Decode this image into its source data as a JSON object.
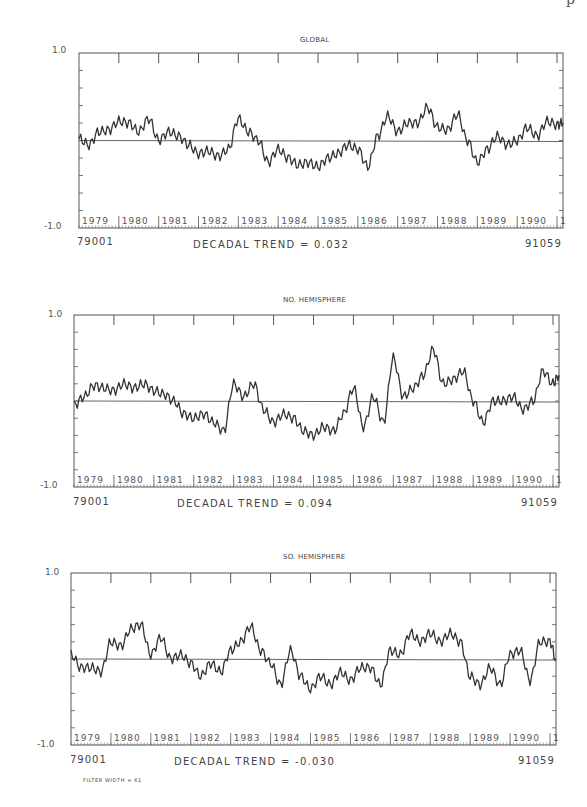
{
  "header_partial_text": "p",
  "footer": {
    "filter_width": "FILTER WIDTH = 61"
  },
  "panels": [
    {
      "title": "GLOBAL",
      "y_max": "1.0",
      "y_min": "-1.0",
      "start_label": "79001",
      "end_label": "91059",
      "trend": "DECADAL TREND =  0.032"
    },
    {
      "title": "NO. HEMISPHERE",
      "y_max": "1.0",
      "y_min": "-1.0",
      "start_label": "79001",
      "end_label": "91059",
      "trend": "DECADAL TREND =  0.094"
    },
    {
      "title": "SO. HEMISPHERE",
      "y_max": "1.0",
      "y_min": "-1.0",
      "start_label": "79001",
      "end_label": "91059",
      "trend": "DECADAL TREND = -0.030"
    }
  ],
  "chart_data": [
    {
      "type": "line",
      "title": "GLOBAL",
      "xlabel": "79001 ... 91059",
      "ylabel": "",
      "ylim": [
        -1.0,
        1.0
      ],
      "x_tick_labels": [
        "1979",
        "1980",
        "1981",
        "1982",
        "1983",
        "1984",
        "1985",
        "1986",
        "1987",
        "1988",
        "1989",
        "1990",
        "1"
      ],
      "annotation": "DECADAL TREND = 0.032",
      "reference_line": 0.0,
      "x": [
        1979.0,
        1979.25,
        1979.5,
        1979.75,
        1980.0,
        1980.25,
        1980.5,
        1980.75,
        1981.0,
        1981.25,
        1981.5,
        1981.75,
        1982.0,
        1982.25,
        1982.5,
        1982.75,
        1983.0,
        1983.25,
        1983.5,
        1983.75,
        1984.0,
        1984.25,
        1984.5,
        1984.75,
        1985.0,
        1985.25,
        1985.5,
        1985.75,
        1986.0,
        1986.25,
        1986.5,
        1986.75,
        1987.0,
        1987.25,
        1987.5,
        1987.75,
        1988.0,
        1988.25,
        1988.5,
        1988.75,
        1989.0,
        1989.25,
        1989.5,
        1989.75,
        1990.0,
        1990.25,
        1990.5,
        1990.75,
        1991.0,
        1991.15
      ],
      "values": [
        0.02,
        -0.05,
        0.1,
        0.12,
        0.22,
        0.2,
        0.1,
        0.25,
        0.0,
        0.1,
        0.05,
        -0.05,
        -0.15,
        -0.12,
        -0.18,
        -0.1,
        0.25,
        0.1,
        0.0,
        -0.25,
        -0.1,
        -0.2,
        -0.28,
        -0.25,
        -0.3,
        -0.2,
        -0.15,
        -0.05,
        -0.1,
        -0.3,
        0.05,
        0.28,
        0.1,
        0.2,
        0.2,
        0.38,
        0.15,
        0.12,
        0.3,
        0.0,
        -0.25,
        -0.1,
        0.05,
        -0.05,
        0.0,
        0.15,
        0.05,
        0.22,
        0.18,
        0.2
      ]
    },
    {
      "type": "line",
      "title": "NO. HEMISPHERE",
      "xlabel": "79001 ... 91059",
      "ylabel": "",
      "ylim": [
        -1.0,
        1.0
      ],
      "x_tick_labels": [
        "1979",
        "1980",
        "1981",
        "1982",
        "1983",
        "1984",
        "1985",
        "1986",
        "1987",
        "1988",
        "1989",
        "1990",
        "1"
      ],
      "annotation": "DECADAL TREND = 0.094",
      "reference_line": 0.0,
      "x": [
        1979.0,
        1979.25,
        1979.5,
        1979.75,
        1980.0,
        1980.25,
        1980.5,
        1980.75,
        1981.0,
        1981.25,
        1981.5,
        1981.75,
        1982.0,
        1982.25,
        1982.5,
        1982.75,
        1983.0,
        1983.25,
        1983.5,
        1983.75,
        1984.0,
        1984.25,
        1984.5,
        1984.75,
        1985.0,
        1985.25,
        1985.5,
        1985.75,
        1986.0,
        1986.25,
        1986.5,
        1986.75,
        1987.0,
        1987.25,
        1987.5,
        1987.75,
        1988.0,
        1988.25,
        1988.5,
        1988.75,
        1989.0,
        1989.25,
        1989.5,
        1989.75,
        1990.0,
        1990.25,
        1990.5,
        1990.75,
        1991.0,
        1991.15
      ],
      "values": [
        -0.05,
        0.05,
        0.18,
        0.15,
        0.12,
        0.2,
        0.15,
        0.2,
        0.12,
        0.08,
        0.0,
        -0.15,
        -0.2,
        -0.15,
        -0.25,
        -0.35,
        0.2,
        0.05,
        0.2,
        -0.1,
        -0.25,
        -0.15,
        -0.2,
        -0.35,
        -0.4,
        -0.3,
        -0.35,
        -0.15,
        0.15,
        -0.3,
        0.05,
        -0.25,
        0.5,
        0.05,
        0.15,
        0.3,
        0.6,
        0.2,
        0.25,
        0.35,
        0.0,
        -0.25,
        0.0,
        0.0,
        0.05,
        -0.1,
        0.0,
        0.35,
        0.2,
        0.3
      ]
    },
    {
      "type": "line",
      "title": "SO. HEMISPHERE",
      "xlabel": "79001 ... 91059",
      "ylabel": "",
      "ylim": [
        -1.0,
        1.0
      ],
      "x_tick_labels": [
        "1979",
        "1980",
        "1981",
        "1982",
        "1983",
        "1984",
        "1985",
        "1986",
        "1987",
        "1988",
        "1989",
        "1990",
        "1"
      ],
      "annotation": "DECADAL TREND = -0.030",
      "reference_line": 0.0,
      "x": [
        1979.0,
        1979.25,
        1979.5,
        1979.75,
        1980.0,
        1980.25,
        1980.5,
        1980.75,
        1981.0,
        1981.25,
        1981.5,
        1981.75,
        1982.0,
        1982.25,
        1982.5,
        1982.75,
        1983.0,
        1983.25,
        1983.5,
        1983.75,
        1984.0,
        1984.25,
        1984.5,
        1984.75,
        1985.0,
        1985.25,
        1985.5,
        1985.75,
        1986.0,
        1986.25,
        1986.5,
        1986.75,
        1987.0,
        1987.25,
        1987.5,
        1987.75,
        1988.0,
        1988.25,
        1988.5,
        1988.75,
        1989.0,
        1989.25,
        1989.5,
        1989.75,
        1990.0,
        1990.25,
        1990.5,
        1990.75,
        1991.0,
        1991.15
      ],
      "values": [
        0.05,
        -0.1,
        -0.1,
        -0.15,
        0.2,
        0.15,
        0.35,
        0.4,
        0.05,
        0.25,
        0.0,
        0.05,
        -0.05,
        -0.2,
        -0.05,
        -0.15,
        0.1,
        0.2,
        0.38,
        0.1,
        -0.05,
        -0.3,
        0.1,
        -0.2,
        -0.35,
        -0.2,
        -0.3,
        -0.15,
        -0.25,
        -0.1,
        -0.1,
        -0.3,
        0.1,
        0.05,
        0.3,
        0.2,
        0.3,
        0.2,
        0.3,
        0.2,
        -0.2,
        -0.3,
        -0.1,
        -0.3,
        0.05,
        0.1,
        -0.25,
        0.2,
        0.2,
        0.0
      ]
    }
  ]
}
